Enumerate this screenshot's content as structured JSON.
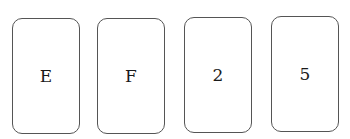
{
  "cards": [
    {
      "face": "E"
    },
    {
      "face": "F"
    },
    {
      "face": "2"
    },
    {
      "face": "5"
    }
  ],
  "colors": {
    "card_border": "#555555",
    "card_background": "#ffffff",
    "text": "#1a1a1a"
  }
}
